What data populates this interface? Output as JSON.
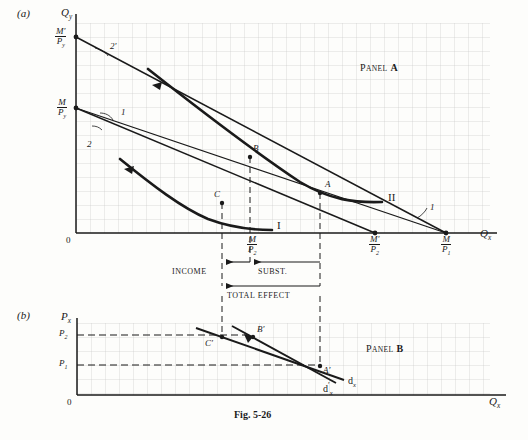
{
  "figure": {
    "caption": "Fig. 5-26",
    "panel_a_tag": "(a)",
    "panel_b_tag": "(b)",
    "panel_a_name_first": "P",
    "panel_a_name_rest": "ANEL",
    "panel_a_letter": "A",
    "panel_b_letter": "B"
  },
  "panel_a": {
    "y_axis_label_main": "Q",
    "y_axis_label_sub": "y",
    "x_axis_label_main": "Q",
    "x_axis_label_sub": "x",
    "origin": "0",
    "y_intercepts": [
      {
        "id": "m-prime-over-py",
        "num": "M′",
        "den": "P",
        "den_sub": "y"
      },
      {
        "id": "m-over-py",
        "num": "M",
        "den": "P",
        "den_sub": "y"
      }
    ],
    "x_intercepts": [
      {
        "id": "m-over-p2",
        "num": "M",
        "den": "P",
        "den_sub": "2"
      },
      {
        "id": "m-prime-over-p2",
        "num": "M′",
        "den": "P",
        "den_sub": "2"
      },
      {
        "id": "m-over-p1",
        "num": "M",
        "den": "P",
        "den_sub": "1"
      }
    ],
    "budget_line_labels": [
      {
        "id": "budget-line-2-prime",
        "text": "2′"
      },
      {
        "id": "budget-line-1-upper",
        "text": "1"
      },
      {
        "id": "budget-line-2",
        "text": "2"
      },
      {
        "id": "budget-line-1-lower",
        "text": "1"
      }
    ],
    "indifference_curve_labels": [
      {
        "id": "indifference-curve-I",
        "text": "I"
      },
      {
        "id": "indifference-curve-II",
        "text": "II"
      }
    ],
    "equilibrium_points": [
      {
        "id": "point-A",
        "text": "A"
      },
      {
        "id": "point-B",
        "text": "B"
      },
      {
        "id": "point-C",
        "text": "C"
      }
    ]
  },
  "effects": {
    "income": "INCOME",
    "substitution": "SUBST.",
    "total": "TOTAL EFFECT"
  },
  "panel_b": {
    "y_axis_label_main": "P",
    "y_axis_label_sub": "x",
    "x_axis_label_main": "Q",
    "x_axis_label_sub": "x",
    "origin": "0",
    "price_ticks": [
      {
        "id": "price-P2",
        "main": "P",
        "sub": "2"
      },
      {
        "id": "price-P1",
        "main": "P",
        "sub": "1"
      }
    ],
    "demand_curve_labels": [
      {
        "id": "demand-curve-dx",
        "main": "d",
        "sub": "x",
        "prime": ""
      },
      {
        "id": "demand-curve-dx-prime",
        "main": "d",
        "sub": "x",
        "prime": "′"
      }
    ],
    "points": [
      {
        "id": "point-A-prime",
        "text": "A′"
      },
      {
        "id": "point-B-prime",
        "text": "B′"
      },
      {
        "id": "point-C-prime",
        "text": "C′"
      }
    ]
  },
  "colors": {
    "ink": "#1a1a1a",
    "grid": "#c9c9c9",
    "paper": "#fdfdfb"
  }
}
